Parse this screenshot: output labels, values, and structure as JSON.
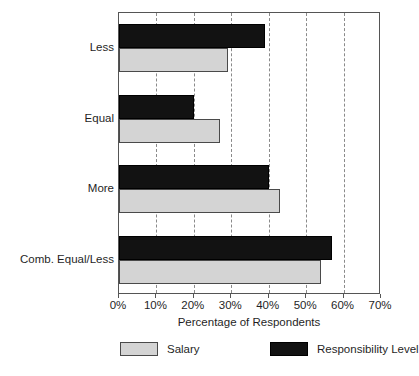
{
  "chart_data": {
    "type": "bar",
    "orientation": "horizontal",
    "title": "",
    "xlabel": "Percentage of Respondents",
    "ylabel": "",
    "xlim": [
      0,
      70
    ],
    "xticks": [
      "0%",
      "10%",
      "20%",
      "30%",
      "40%",
      "50%",
      "60%",
      "70%"
    ],
    "xtick_values": [
      0,
      10,
      20,
      30,
      40,
      50,
      60,
      70
    ],
    "grid": "vertical-dashed",
    "legend_position": "bottom",
    "categories": [
      "Less",
      "Equal",
      "More",
      "Comb. Equal/Less"
    ],
    "series": [
      {
        "name": "Salary",
        "color": "#d4d4d4",
        "values": [
          29,
          27,
          43,
          54
        ]
      },
      {
        "name": "Responsibility Level",
        "color": "#121212",
        "values": [
          39,
          20,
          40,
          57
        ]
      }
    ]
  },
  "axis": {
    "x_title": "Percentage of Respondents"
  },
  "legend": {
    "items": [
      {
        "label": "Salary",
        "swatch": "salary"
      },
      {
        "label": "Responsibility Level",
        "swatch": "resp"
      }
    ]
  },
  "caption": {
    "text": ""
  }
}
